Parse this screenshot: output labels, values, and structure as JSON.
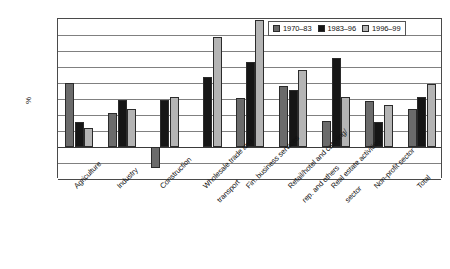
{
  "chart_data": {
    "type": "bar",
    "title": "",
    "subtitle": "",
    "xlabel": "",
    "ylabel": "%",
    "ylim": [
      -2,
      8
    ],
    "yticks": [
      8,
      7,
      6,
      5,
      4,
      3,
      2,
      1,
      0,
      -1,
      -2
    ],
    "ytick_labels": [
      "8",
      "7",
      "6",
      "5",
      "4",
      "3",
      "2",
      "1",
      "0",
      "-1",
      "-2"
    ],
    "grid": true,
    "legend_position": "top-right",
    "categories": [
      "Agriculture",
      "Industry",
      "Construction",
      "Wholesale trade and transport",
      "Fin. business services",
      "Retail/hotel and catering/ rep. and others",
      "Real estate activities sector",
      "Non-profit sector",
      "Total"
    ],
    "category_label_lines": [
      [
        "Agriculture"
      ],
      [
        "Industry"
      ],
      [
        "Construction"
      ],
      [
        "Wholesale trade and",
        "transport"
      ],
      [
        "Fin. business services"
      ],
      [
        "Retail/hotel and catering/",
        "rep. and others"
      ],
      [
        "Real estate activities",
        "sector"
      ],
      [
        "Non-profit sector"
      ],
      [
        "Total"
      ]
    ],
    "series": [
      {
        "name": "1970–83",
        "color": "#6b6b6b",
        "values": [
          4.0,
          2.1,
          -1.3,
          null,
          3.05,
          3.8,
          1.6,
          2.9,
          2.35
        ]
      },
      {
        "name": "1983–96",
        "color": "#161616",
        "values": [
          1.55,
          2.95,
          2.95,
          4.35,
          5.3,
          3.55,
          5.55,
          1.55,
          3.15
        ]
      },
      {
        "name": "1996–99",
        "color": "#b4b4b4",
        "values": [
          1.2,
          2.4,
          3.1,
          6.9,
          7.95,
          4.8,
          3.1,
          2.6,
          3.95
        ]
      }
    ]
  },
  "legend": {
    "items": [
      {
        "label": "1970–83",
        "swatch_name": "legend-swatch-series-1"
      },
      {
        "label": "1983–96",
        "swatch_name": "legend-swatch-series-2"
      },
      {
        "label": "1996–99",
        "swatch_name": "legend-swatch-series-3"
      }
    ]
  },
  "axis": {
    "y_title": "%"
  }
}
